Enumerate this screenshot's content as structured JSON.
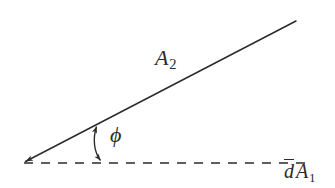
{
  "figure": {
    "background_color": "#ffffff",
    "stroke_color": "#2b2b2b",
    "width": 335,
    "height": 188,
    "labels": {
      "a2": {
        "base": "A",
        "subscript": "2",
        "text": "A2"
      },
      "phi": {
        "glyph": "ϕ",
        "text": "ϕ"
      },
      "da1": {
        "d_overline": "d",
        "base": "A",
        "subscript": "1",
        "text": "dA1"
      }
    },
    "geometry": {
      "vertex": {
        "x": 22,
        "y": 163
      },
      "slant_line": {
        "name": "A2",
        "from": {
          "x": 22,
          "y": 163
        },
        "to": {
          "x": 296,
          "y": 21
        },
        "style": "solid",
        "arrowhead_at": "from",
        "angle_degrees": 27.4
      },
      "baseline": {
        "name": "dA1",
        "from": {
          "x": 22,
          "y": 163
        },
        "to": {
          "x": 312,
          "y": 163
        },
        "style": "dashed",
        "dash_length": 9,
        "gap_length": 8
      },
      "angle_arrow": {
        "name": "phi",
        "from": {
          "x": 96,
          "y": 125
        },
        "to": {
          "x": 101,
          "y": 162
        },
        "style": "curved double-headed arrow",
        "measures": "ϕ"
      }
    }
  }
}
